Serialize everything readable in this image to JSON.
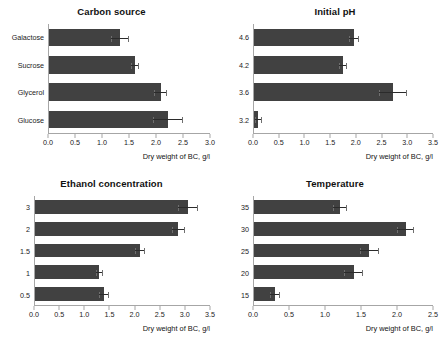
{
  "figure": {
    "xlabel": "Dry weight of BC, g/l",
    "bar_color": "#414141",
    "axis_color": "#a6a6a6"
  },
  "chart_data": [
    {
      "type": "bar",
      "orientation": "horizontal",
      "title": "Carbon source",
      "xlabel": "Dry weight of BC, g/l",
      "ylabel": "",
      "xlim": [
        0.0,
        3.0
      ],
      "xticks": [
        "0.0",
        "0.5",
        "1.0",
        "1.5",
        "2.0",
        "2.5",
        "3.0"
      ],
      "xtick_values": [
        0.0,
        0.5,
        1.0,
        1.5,
        2.0,
        2.5,
        3.0
      ],
      "grid": false,
      "legend": "none",
      "categories": [
        "Galactose",
        "Sucrose",
        "Glycerol",
        "Glucose"
      ],
      "values": [
        1.33,
        1.6,
        2.08,
        2.22
      ],
      "errors": [
        0.17,
        0.08,
        0.12,
        0.28
      ]
    },
    {
      "type": "bar",
      "orientation": "horizontal",
      "title": "Initial pH",
      "xlabel": "Dry weight of BC, g/l",
      "ylabel": "",
      "xlim": [
        0.0,
        3.5
      ],
      "xticks": [
        "0.0",
        "0.5",
        "1.0",
        "1.5",
        "2.0",
        "2.5",
        "3.0",
        "3.5"
      ],
      "xtick_values": [
        0.0,
        0.5,
        1.0,
        1.5,
        2.0,
        2.5,
        3.0,
        3.5
      ],
      "grid": false,
      "legend": "none",
      "categories": [
        "4.6",
        "4.2",
        "3.6",
        "3.2"
      ],
      "values": [
        1.95,
        1.74,
        2.72,
        0.08
      ],
      "errors": [
        0.1,
        0.07,
        0.28,
        0.07
      ]
    },
    {
      "type": "bar",
      "orientation": "horizontal",
      "title": "Ethanol concentration",
      "xlabel": "Dry weight of BC, g/l",
      "ylabel": "",
      "xlim": [
        0.0,
        3.5
      ],
      "xticks": [
        "0.0",
        "0.5",
        "1.0",
        "1.5",
        "2.0",
        "2.5",
        "3.0",
        "3.5"
      ],
      "xtick_values": [
        0.0,
        0.5,
        1.0,
        1.5,
        2.0,
        2.5,
        3.0,
        3.5
      ],
      "grid": false,
      "legend": "none",
      "categories": [
        "3",
        "2",
        "1.5",
        "1",
        "0.5"
      ],
      "values": [
        3.05,
        2.86,
        2.09,
        1.28,
        1.38
      ],
      "errors": [
        0.2,
        0.13,
        0.1,
        0.07,
        0.1
      ]
    },
    {
      "type": "bar",
      "orientation": "horizontal",
      "title": "Temperature",
      "xlabel": "Dry weight of BC, g/l",
      "ylabel": "",
      "xlim": [
        0.0,
        2.5
      ],
      "xticks": [
        "0.0",
        "0.5",
        "1.0",
        "1.5",
        "2.0",
        "2.5"
      ],
      "xtick_values": [
        0.0,
        0.5,
        1.0,
        1.5,
        2.0,
        2.5
      ],
      "grid": false,
      "legend": "none",
      "categories": [
        "35",
        "30",
        "25",
        "20",
        "15"
      ],
      "values": [
        1.2,
        2.12,
        1.61,
        1.39,
        0.29
      ],
      "errors": [
        0.1,
        0.12,
        0.13,
        0.13,
        0.07
      ]
    }
  ]
}
